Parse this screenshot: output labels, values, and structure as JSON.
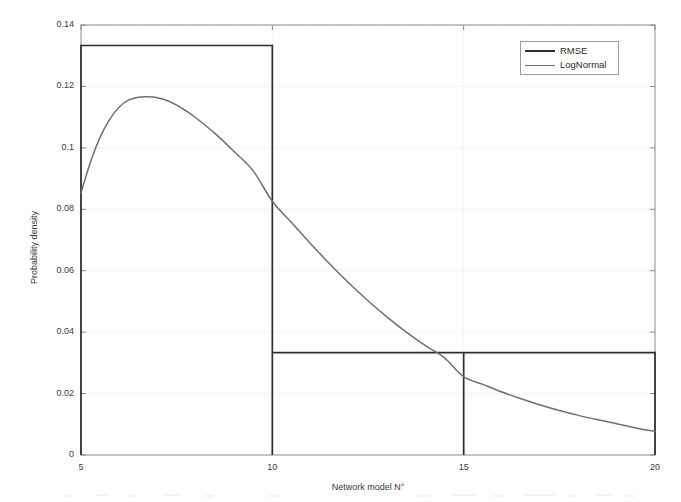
{
  "chart_data": {
    "type": "line",
    "title": "",
    "xlabel": "Network model N°",
    "ylabel": "Probability density",
    "xlim": [
      5,
      20
    ],
    "ylim": [
      0,
      0.14
    ],
    "grid": true,
    "grid_style": "dotted",
    "legend_position": "upper right",
    "xticks": [
      5,
      10,
      15,
      20
    ],
    "xtick_labels": [
      "5",
      "10",
      "15",
      "20"
    ],
    "yticks": [
      0,
      0.02,
      0.04,
      0.06,
      0.08,
      0.1,
      0.12,
      0.14
    ],
    "ytick_labels": [
      "0",
      "0.02",
      "0.04",
      "0.06",
      "0.08",
      "0.1",
      "0.12",
      "0.14"
    ],
    "series": [
      {
        "name": "RMSE",
        "type": "histogram",
        "color": "#2e2e2e",
        "linewidth": 2,
        "bin_edges": [
          5,
          10,
          15,
          20
        ],
        "values": [
          0.13333,
          0.03333,
          0.03333
        ]
      },
      {
        "name": "LogNormal",
        "type": "line",
        "color": "#6f6f6f",
        "linewidth": 1.5,
        "x": [
          5,
          5.25,
          5.5,
          5.75,
          6,
          6.25,
          6.5,
          6.75,
          7,
          7.25,
          7.5,
          7.75,
          8,
          8.5,
          9,
          9.5,
          10,
          10.5,
          11,
          11.5,
          12,
          12.5,
          13,
          13.5,
          14,
          14.5,
          15,
          15.5,
          16,
          16.5,
          17,
          17.5,
          18,
          18.5,
          19,
          19.5,
          20
        ],
        "y": [
          0.0853,
          0.0955,
          0.1035,
          0.1093,
          0.1133,
          0.1156,
          0.1165,
          0.1166,
          0.1163,
          0.1154,
          0.1139,
          0.112,
          0.1098,
          0.1047,
          0.0988,
          0.0925,
          0.0826,
          0.0757,
          0.0688,
          0.0622,
          0.056,
          0.0502,
          0.0449,
          0.04,
          0.0356,
          0.0316,
          0.0255,
          0.023,
          0.0205,
          0.0183,
          0.0163,
          0.0145,
          0.0129,
          0.0115,
          0.0102,
          0.0088,
          0.0077
        ]
      }
    ]
  },
  "legend": {
    "entries": [
      {
        "label": "RMSE",
        "swatch": "rmse"
      },
      {
        "label": "LogNormal",
        "swatch": "lognormal"
      }
    ]
  },
  "axes": {
    "x_title": "Network model N°",
    "y_title": "Probability density"
  },
  "colors": {
    "histogram": "#2e2e2e",
    "curve": "#6f6f6f",
    "axis": "#8a8a8a",
    "grid": "#dcdcdc",
    "text": "#3a3a3a",
    "background": "#ffffff"
  }
}
